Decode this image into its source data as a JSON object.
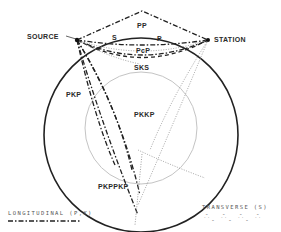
{
  "diagram": {
    "labels": {
      "source": "SOURCE",
      "station": "STATION",
      "pp": "PP",
      "s": "S",
      "p": "P",
      "pcp": "PcP",
      "sks": "SKS",
      "pkp": "PKP",
      "pkkp": "PKKP",
      "pkppkp": "PKPPKP"
    },
    "legend": {
      "longitudinal": "LONGITUDINAL (P,K)",
      "transverse": "TRANSVERSE (S)"
    },
    "colors": {
      "mantle_outline": "#222222",
      "core_outline": "#bbbbbb",
      "longitudinal_ray": "#222222",
      "transverse_ray": "#888888"
    }
  }
}
